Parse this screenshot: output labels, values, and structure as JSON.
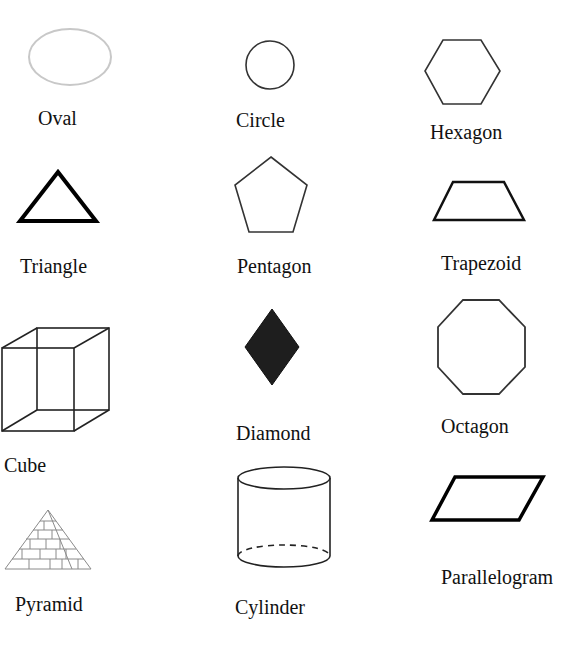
{
  "shapes": [
    {
      "id": "oval",
      "label": "Oval"
    },
    {
      "id": "circle",
      "label": "Circle"
    },
    {
      "id": "hexagon",
      "label": "Hexagon"
    },
    {
      "id": "triangle",
      "label": "Triangle"
    },
    {
      "id": "pentagon",
      "label": "Pentagon"
    },
    {
      "id": "trapezoid",
      "label": "Trapezoid"
    },
    {
      "id": "cube",
      "label": "Cube"
    },
    {
      "id": "diamond",
      "label": "Diamond"
    },
    {
      "id": "octagon",
      "label": "Octagon"
    },
    {
      "id": "pyramid",
      "label": "Pyramid"
    },
    {
      "id": "cylinder",
      "label": "Cylinder"
    },
    {
      "id": "parallelogram",
      "label": "Parallelogram"
    }
  ],
  "colors": {
    "stroke": "#222222",
    "oval_stroke": "#c8c8c8",
    "diamond_fill": "#1e1e1e",
    "pyramid_stroke": "#8a8a8a"
  }
}
